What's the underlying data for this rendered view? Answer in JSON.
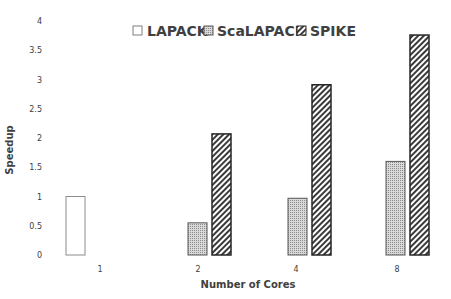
{
  "chart_data": {
    "type": "bar",
    "title": "",
    "xlabel": "Number of Cores",
    "ylabel": "Speedup",
    "ylim": [
      0,
      4
    ],
    "yticks": [
      0,
      0.5,
      1,
      1.5,
      2,
      2.5,
      3,
      3.5,
      4
    ],
    "ytick_labels": [
      "0",
      "0.5",
      "1",
      "1.5",
      "2",
      "2.5",
      "3",
      "3.5",
      "4"
    ],
    "grid": false,
    "legend_position": "top",
    "categories": [
      "1",
      "2",
      "4",
      "8"
    ],
    "series": [
      {
        "name": "LAPACK",
        "pattern": "none",
        "values": [
          1.0,
          null,
          null,
          null
        ]
      },
      {
        "name": "ScaLAPACK",
        "pattern": "grid",
        "values": [
          null,
          0.55,
          0.97,
          1.6
        ]
      },
      {
        "name": "SPIKE",
        "pattern": "diagonal",
        "values": [
          null,
          2.07,
          2.91,
          3.76
        ]
      }
    ]
  },
  "legend": {
    "items": [
      "LAPACK",
      "ScaLAPACK",
      "SPIKE"
    ]
  },
  "colors": {
    "text": "#404040",
    "bar_outline": "#595959",
    "spike_outline": "#262626",
    "pattern": "#7f7f7f"
  }
}
